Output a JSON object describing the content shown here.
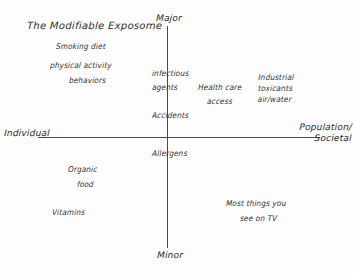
{
  "diagram": {
    "title": "The Modifiable Exposome",
    "type": "2x2-matrix",
    "axes": {
      "vertical": {
        "top_label": "Major",
        "bottom_label": "Minor"
      },
      "horizontal": {
        "left_label": "Individual",
        "right_label": "Population/\nSocietal"
      }
    },
    "items": {
      "top_left": [
        {
          "id": "smoking-diet",
          "text": "Smoking  diet"
        },
        {
          "id": "physical-activity",
          "text": "physical activity"
        },
        {
          "id": "behaviors",
          "text": "behaviors"
        }
      ],
      "top_center": [
        {
          "id": "infectious",
          "text": "infectious"
        },
        {
          "id": "agents",
          "text": "agents"
        },
        {
          "id": "accidents",
          "text": "Accidents"
        }
      ],
      "top_right_inner": [
        {
          "id": "health-care",
          "text": "Health care"
        },
        {
          "id": "access",
          "text": "access"
        }
      ],
      "top_right_outer": [
        {
          "id": "industrial-toxicants",
          "text": "Industrial\ntoxicants\nair/water"
        }
      ],
      "bottom_center": [
        {
          "id": "allergens",
          "text": "Allergens"
        }
      ],
      "bottom_left": [
        {
          "id": "organic",
          "text": "Organic"
        },
        {
          "id": "food",
          "text": "food"
        },
        {
          "id": "vitamins",
          "text": "Vitamins"
        }
      ],
      "bottom_right": [
        {
          "id": "most-things-1",
          "text": "Most things you"
        },
        {
          "id": "most-things-2",
          "text": "see on TV"
        }
      ]
    },
    "colors": {
      "ink": "#2e2e2e",
      "axis": "#4a4a4a",
      "background": "#fdfdfd"
    }
  }
}
